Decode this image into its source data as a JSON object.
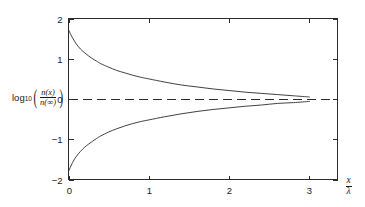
{
  "figure": {
    "background_color": "#ffffff",
    "line_color": "#2b2b2b"
  },
  "chart_data": {
    "type": "line",
    "title": "",
    "subtitle": "",
    "xlabel": "x/λ",
    "ylabel": "log10(n(x)/n(∞))",
    "xlabel_parts": {
      "numerator": "x",
      "denominator": "λ"
    },
    "ylabel_parts": {
      "function": "log",
      "subscript": "10",
      "numerator": "n(x)",
      "denominator": "n(∞)"
    },
    "xlim": [
      0,
      3.35
    ],
    "ylim": [
      -2,
      2
    ],
    "xticks": [
      0,
      1,
      2,
      3
    ],
    "xticklabels": [
      "0",
      "1",
      "2",
      "3"
    ],
    "yticks": [
      -2,
      -1,
      0,
      1,
      2
    ],
    "yticklabels": [
      "−2",
      "−1",
      "0",
      "1",
      "2"
    ],
    "grid": false,
    "legend": null,
    "frame": "box",
    "ticks_inward": true,
    "annotations": [
      {
        "name": "zero-reference-line",
        "type": "hline",
        "y": 0,
        "style": "dashed",
        "label": ""
      }
    ],
    "series": [
      {
        "name": "upper-branch",
        "style": "solid",
        "x": [
          0.0,
          0.05,
          0.1,
          0.15,
          0.2,
          0.25,
          0.3,
          0.35,
          0.4,
          0.5,
          0.6,
          0.7,
          0.8,
          0.9,
          1.0,
          1.2,
          1.4,
          1.6,
          1.8,
          2.0,
          2.2,
          2.4,
          2.6,
          2.8,
          3.0
        ],
        "values": [
          1.72,
          1.52,
          1.36,
          1.24,
          1.15,
          1.07,
          1.0,
          0.94,
          0.88,
          0.79,
          0.71,
          0.65,
          0.59,
          0.54,
          0.5,
          0.42,
          0.35,
          0.3,
          0.25,
          0.21,
          0.17,
          0.14,
          0.11,
          0.08,
          0.05
        ]
      },
      {
        "name": "lower-branch",
        "style": "solid",
        "x": [
          0.0,
          0.05,
          0.1,
          0.15,
          0.2,
          0.25,
          0.3,
          0.35,
          0.4,
          0.5,
          0.6,
          0.7,
          0.8,
          0.9,
          1.0,
          1.2,
          1.4,
          1.6,
          1.8,
          2.0,
          2.2,
          2.4,
          2.6,
          2.8,
          3.0
        ],
        "values": [
          -1.8,
          -1.58,
          -1.42,
          -1.3,
          -1.2,
          -1.12,
          -1.05,
          -0.98,
          -0.92,
          -0.82,
          -0.74,
          -0.67,
          -0.61,
          -0.56,
          -0.52,
          -0.44,
          -0.37,
          -0.31,
          -0.26,
          -0.22,
          -0.18,
          -0.15,
          -0.11,
          -0.09,
          -0.06
        ]
      }
    ]
  }
}
